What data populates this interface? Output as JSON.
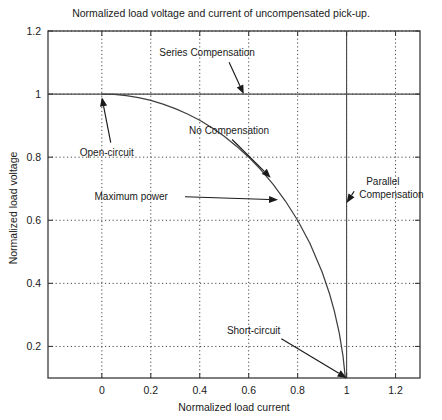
{
  "chart_data": {
    "type": "line",
    "title": "Normalized load voltage and current of uncompensated pick-up.",
    "xlabel": "Normalized load current",
    "ylabel": "Normalized load voltage",
    "xlim": [
      -0.22,
      1.3
    ],
    "ylim": [
      0.1,
      1.2
    ],
    "grid": true,
    "legend": "none",
    "xticks": [
      "0",
      "0.2",
      "0.4",
      "0.6",
      "0.8",
      "1",
      "1.2"
    ],
    "xtick_values": [
      0,
      0.2,
      0.4,
      0.6,
      0.8,
      1,
      1.2
    ],
    "yticks": [
      "0.2",
      "0.4",
      "0.6",
      "0.8",
      "1",
      "1.2"
    ],
    "ytick_values": [
      0.2,
      0.4,
      0.6,
      0.8,
      1,
      1.2
    ],
    "series": [
      {
        "name": "uncompensated pick-up characteristic",
        "equation": "V = sqrt(1 - I^2)",
        "x": [
          0,
          0.05,
          0.1,
          0.15,
          0.2,
          0.25,
          0.3,
          0.35,
          0.4,
          0.45,
          0.5,
          0.55,
          0.6,
          0.65,
          0.7,
          0.75,
          0.8,
          0.85,
          0.9,
          0.93,
          0.95,
          0.97,
          0.985,
          0.995,
          1
        ],
        "y": [
          1,
          0.999,
          0.995,
          0.989,
          0.98,
          0.968,
          0.954,
          0.937,
          0.917,
          0.893,
          0.866,
          0.835,
          0.8,
          0.76,
          0.714,
          0.661,
          0.6,
          0.527,
          0.436,
          0.368,
          0.312,
          0.243,
          0.172,
          0.1,
          0
        ]
      }
    ],
    "reference_lines": [
      {
        "name": "series-compensation-line",
        "orientation": "horizontal",
        "value": 1
      },
      {
        "name": "parallel-compensation-line",
        "orientation": "vertical",
        "value": 1
      }
    ],
    "annotations": [
      {
        "name": "series-compensation",
        "label": "Series Compensation",
        "text_x": 0.43,
        "text_y": 1.12,
        "point_x": 0.58,
        "point_y": 1.0
      },
      {
        "name": "open-circuit",
        "label": "Open-circuit",
        "text_x": 0.02,
        "text_y": 0.805,
        "point_x": 0.0,
        "point_y": 0.99
      },
      {
        "name": "no-compensation",
        "label": "No Compensation",
        "text_x": 0.52,
        "text_y": 0.875,
        "point_x": 0.69,
        "point_y": 0.735
      },
      {
        "name": "maximum-power",
        "label": "Maximum power",
        "text_x": 0.12,
        "text_y": 0.665,
        "point_x": 0.72,
        "point_y": 0.665
      },
      {
        "name": "parallel-compensation",
        "label": "Parallel Compensation",
        "label_line1": "Parallel",
        "label_line2": "Compensation",
        "text_x": 1.08,
        "text_y": 0.695,
        "point_x": 1.0,
        "point_y": 0.655
      },
      {
        "name": "short-circuit",
        "label": "Short-circuit",
        "text_x": 0.62,
        "text_y": 0.24,
        "point_x": 1.0,
        "point_y": 0.1
      }
    ],
    "colors": {
      "background": "#ffffff",
      "curve": "#404040",
      "grid": "#333333",
      "axis": "#3a3a3a",
      "text": "#1a1a1a"
    }
  }
}
